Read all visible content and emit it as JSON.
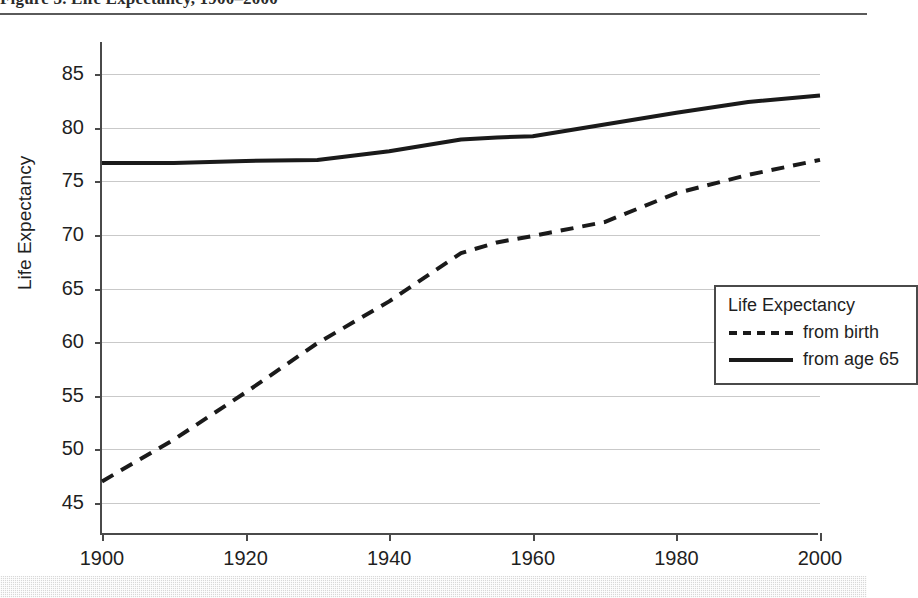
{
  "document": {
    "caption_fragment": "Figure 3.  Life Expectancy, 1900–2000",
    "caption_rule": "horizontal-rule"
  },
  "chart_data": {
    "type": "line",
    "title": "",
    "xlabel": "",
    "ylabel": "Life Expectancy",
    "xlim": [
      1900,
      2000
    ],
    "ylim": [
      42,
      88
    ],
    "grid": true,
    "legend_position": "inside-right",
    "legend_title": "Life Expectancy",
    "x_ticks": [
      1900,
      1920,
      1940,
      1960,
      1980,
      2000
    ],
    "y_ticks": [
      45,
      50,
      55,
      60,
      65,
      70,
      75,
      80,
      85
    ],
    "x": [
      1900,
      1910,
      1920,
      1930,
      1940,
      1950,
      1955,
      1960,
      1970,
      1980,
      1990,
      2000
    ],
    "series": [
      {
        "name": "from birth",
        "style": "dashed",
        "color": "#1a1a1a",
        "values": [
          47.0,
          50.9,
          55.3,
          59.9,
          63.8,
          68.3,
          69.3,
          69.9,
          71.2,
          73.9,
          75.6,
          77.0
        ]
      },
      {
        "name": "from age 65",
        "style": "solid",
        "color": "#1a1a1a",
        "values": [
          76.7,
          76.7,
          76.9,
          77.0,
          77.8,
          78.9,
          79.1,
          79.2,
          80.3,
          81.4,
          82.4,
          83.0
        ]
      }
    ]
  },
  "legend": {
    "title": "Life Expectancy",
    "entries": [
      {
        "label": "from birth",
        "style": "dashed"
      },
      {
        "label": "from age 65",
        "style": "solid"
      }
    ]
  },
  "colors": {
    "gridline": "#c9c9c9",
    "axis": "#4a4a4a",
    "series": "#1a1a1a",
    "band": "#d8d8d8"
  }
}
